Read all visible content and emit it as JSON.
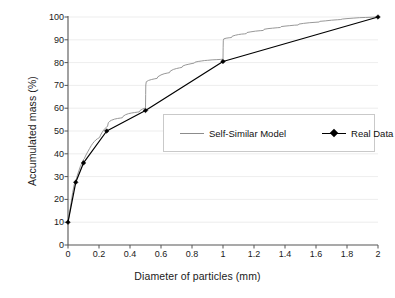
{
  "chart_data": {
    "type": "line",
    "title": "",
    "xlabel": "Diameter of particles (mm)",
    "ylabel": "Accumulated mass (%)",
    "xlim": [
      0,
      2
    ],
    "ylim": [
      0,
      100
    ],
    "xticks": [
      "0",
      "0.2",
      "0.4",
      "0.6",
      "0.8",
      "1",
      "1.2",
      "1.4",
      "1.6",
      "1.8",
      "2"
    ],
    "xtick_values": [
      0,
      0.2,
      0.4,
      0.6,
      0.8,
      1.0,
      1.2,
      1.4,
      1.6,
      1.8,
      2.0
    ],
    "yticks": [
      "0",
      "10",
      "20",
      "30",
      "40",
      "50",
      "60",
      "70",
      "80",
      "90",
      "100"
    ],
    "ytick_values": [
      0,
      10,
      20,
      30,
      40,
      50,
      60,
      70,
      80,
      90,
      100
    ],
    "grid": {
      "horizontal": true,
      "vertical": false,
      "color": "#e8e8e8"
    },
    "legend": {
      "position": "center-right",
      "border_color": "#c9c9c9",
      "background": "#ffffff"
    },
    "series": [
      {
        "name": "Self-Similar Model",
        "style": "staircase",
        "color": "#8c8c8c",
        "marker": "none",
        "line_width": 0.9,
        "points": [
          [
            0.0,
            10.0
          ],
          [
            0.01,
            14.0
          ],
          [
            0.02,
            18.5
          ],
          [
            0.03,
            23.0
          ],
          [
            0.04,
            26.5
          ],
          [
            0.05,
            28.5
          ],
          [
            0.055,
            29.0
          ],
          [
            0.06,
            30.5
          ],
          [
            0.07,
            32.5
          ],
          [
            0.08,
            34.5
          ],
          [
            0.09,
            36.0
          ],
          [
            0.1,
            37.5
          ],
          [
            0.105,
            37.8
          ],
          [
            0.11,
            38.6
          ],
          [
            0.12,
            40.0
          ],
          [
            0.13,
            41.2
          ],
          [
            0.14,
            42.4
          ],
          [
            0.15,
            43.6
          ],
          [
            0.16,
            44.6
          ],
          [
            0.17,
            45.4
          ],
          [
            0.18,
            46.1
          ],
          [
            0.19,
            46.6
          ],
          [
            0.2,
            47.0
          ],
          [
            0.205,
            47.3
          ],
          [
            0.21,
            48.2
          ],
          [
            0.22,
            49.4
          ],
          [
            0.23,
            50.4
          ],
          [
            0.24,
            51.2
          ],
          [
            0.25,
            51.8
          ],
          [
            0.255,
            52.0
          ],
          [
            0.26,
            53.6
          ],
          [
            0.27,
            54.3
          ],
          [
            0.28,
            54.7
          ],
          [
            0.3,
            55.2
          ],
          [
            0.32,
            55.5
          ],
          [
            0.34,
            55.7
          ],
          [
            0.35,
            55.8
          ],
          [
            0.355,
            56.4
          ],
          [
            0.37,
            57.1
          ],
          [
            0.39,
            57.6
          ],
          [
            0.41,
            57.9
          ],
          [
            0.43,
            58.1
          ],
          [
            0.45,
            58.3
          ],
          [
            0.46,
            58.4
          ],
          [
            0.465,
            59.0
          ],
          [
            0.48,
            59.6
          ],
          [
            0.495,
            60.0
          ],
          [
            0.499,
            60.2
          ],
          [
            0.5,
            60.4
          ],
          [
            0.501,
            66.0
          ],
          [
            0.502,
            70.2
          ],
          [
            0.505,
            71.6
          ],
          [
            0.52,
            72.2
          ],
          [
            0.54,
            72.6
          ],
          [
            0.56,
            72.9
          ],
          [
            0.575,
            73.1
          ],
          [
            0.58,
            73.8
          ],
          [
            0.6,
            74.6
          ],
          [
            0.62,
            75.1
          ],
          [
            0.64,
            75.4
          ],
          [
            0.655,
            75.6
          ],
          [
            0.66,
            76.3
          ],
          [
            0.68,
            77.0
          ],
          [
            0.7,
            77.4
          ],
          [
            0.72,
            77.7
          ],
          [
            0.735,
            77.9
          ],
          [
            0.74,
            78.5
          ],
          [
            0.76,
            79.0
          ],
          [
            0.78,
            79.3
          ],
          [
            0.8,
            79.6
          ],
          [
            0.815,
            79.8
          ],
          [
            0.82,
            80.2
          ],
          [
            0.84,
            80.5
          ],
          [
            0.86,
            80.7
          ],
          [
            0.88,
            80.9
          ],
          [
            0.9,
            81.0
          ],
          [
            0.93,
            81.2
          ],
          [
            0.96,
            81.3
          ],
          [
            0.985,
            81.4
          ],
          [
            0.999,
            81.5
          ],
          [
            1.0,
            81.6
          ],
          [
            1.001,
            86.5
          ],
          [
            1.002,
            89.6
          ],
          [
            1.005,
            90.4
          ],
          [
            1.02,
            90.7
          ],
          [
            1.04,
            90.9
          ],
          [
            1.055,
            91.0
          ],
          [
            1.06,
            91.6
          ],
          [
            1.08,
            92.0
          ],
          [
            1.1,
            92.3
          ],
          [
            1.12,
            92.5
          ],
          [
            1.14,
            92.6
          ],
          [
            1.15,
            92.7
          ],
          [
            1.155,
            93.2
          ],
          [
            1.18,
            93.5
          ],
          [
            1.21,
            93.8
          ],
          [
            1.24,
            94.0
          ],
          [
            1.26,
            94.1
          ],
          [
            1.265,
            94.6
          ],
          [
            1.29,
            94.9
          ],
          [
            1.32,
            95.1
          ],
          [
            1.35,
            95.3
          ],
          [
            1.37,
            95.4
          ],
          [
            1.375,
            95.8
          ],
          [
            1.4,
            96.0
          ],
          [
            1.43,
            96.2
          ],
          [
            1.46,
            96.4
          ],
          [
            1.485,
            96.5
          ],
          [
            1.49,
            96.9
          ],
          [
            1.52,
            97.2
          ],
          [
            1.56,
            97.5
          ],
          [
            1.6,
            97.7
          ],
          [
            1.62,
            97.8
          ],
          [
            1.625,
            98.1
          ],
          [
            1.66,
            98.3
          ],
          [
            1.7,
            98.6
          ],
          [
            1.74,
            98.8
          ],
          [
            1.76,
            98.9
          ],
          [
            1.77,
            99.1
          ],
          [
            1.8,
            99.3
          ],
          [
            1.84,
            99.5
          ],
          [
            1.88,
            99.7
          ],
          [
            1.92,
            99.8
          ],
          [
            1.96,
            99.9
          ],
          [
            2.0,
            100.0
          ]
        ]
      },
      {
        "name": "Real Data",
        "style": "line-marker",
        "color": "#000000",
        "marker": "diamond",
        "line_width": 1.2,
        "points": [
          [
            0.0,
            10.0
          ],
          [
            0.05,
            27.5
          ],
          [
            0.1,
            36.0
          ],
          [
            0.25,
            50.0
          ],
          [
            0.5,
            59.0
          ],
          [
            1.0,
            80.5
          ],
          [
            2.0,
            100.0
          ]
        ]
      }
    ]
  },
  "axes": {
    "axis_color": "#555555",
    "tick_label_color": "#1a1a1a"
  }
}
